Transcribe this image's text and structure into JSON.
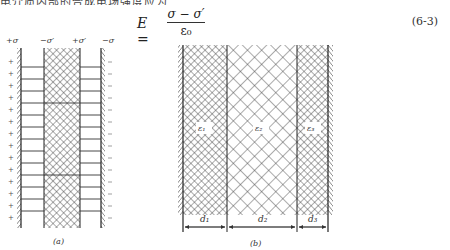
{
  "header": {
    "clipped_text": "电介质内部的合成电场强度应为"
  },
  "equation": {
    "lhs": "E =",
    "numerator": "σ − σ′",
    "denominator": "ε₀",
    "number": "(6-3)"
  },
  "figure_a": {
    "caption": "(a)",
    "labels": [
      "+σ",
      "−σ′",
      "+σ′",
      "−σ"
    ],
    "left_plate_sign": "+",
    "right_plate_sign": "−"
  },
  "figure_b": {
    "caption": "(b)",
    "layers": [
      {
        "permittivity": "ε₁",
        "thickness": "d₁"
      },
      {
        "permittivity": "ε₂",
        "thickness": "d₂"
      },
      {
        "permittivity": "ε₃",
        "thickness": "d₃"
      }
    ]
  }
}
